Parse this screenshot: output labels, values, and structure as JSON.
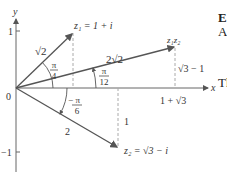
{
  "diagram": {
    "axes": {
      "x_label": "x",
      "y_label": "y",
      "origin_label": "0",
      "y_tick_pos": "1",
      "y_tick_neg": "−1"
    },
    "points": {
      "z1": "z₁ = 1 + i",
      "z1z2": "z₁z₂",
      "z2": "z₂ = √3 − i"
    },
    "lengths": {
      "z1_modulus": "√2",
      "product_modulus": "2√2",
      "z2_modulus": "2"
    },
    "angles": {
      "z1_angle_num": "π",
      "z1_angle_den": "4",
      "product_angle_num": "π",
      "product_angle_den": "12",
      "z2_angle_num": "− π",
      "z2_angle_den": "6"
    },
    "projections": {
      "product_height": "√3 − 1",
      "product_x": "1 + √3",
      "z2_depth": "1"
    },
    "colors": {
      "axis": "#666666",
      "vector": "#555555",
      "dashed": "#aaaaaa",
      "text": "#333333"
    }
  },
  "side_text": {
    "line1": "E",
    "line2": "A",
    "line3": "Th"
  }
}
